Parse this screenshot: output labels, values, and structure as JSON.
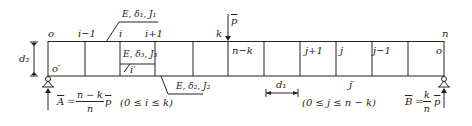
{
  "diagram": {
    "type": "truss-beam-loading",
    "top_left_label": "o",
    "labels_top": {
      "i_minus_1": "i−1",
      "i": "i",
      "i_plus_1": "i+1",
      "k": "k",
      "n": "n"
    },
    "load": {
      "label": "p"
    },
    "panel_labels": {
      "n_minus_k": "n−k",
      "j_plus_1": "j+1",
      "j": "j",
      "j_minus_1": "j−1",
      "o_right": "o"
    },
    "bottom_labels": {
      "o_prime": "o′",
      "i_prime": "i′",
      "j_prime": "j′"
    },
    "top_chord_props": "E, δ₁, J₁",
    "vertical_props": "E, δ₃, J₃",
    "bottom_chord_props": "E, δ₂, J₂",
    "height_dim": "d₂",
    "panel_dim": "d₁",
    "left_reaction": {
      "lhs": "A",
      "num": "n − k",
      "den": "n",
      "tail": "p"
    },
    "right_reaction": {
      "lhs": "B",
      "num": "k",
      "den": "n",
      "tail": "p"
    },
    "range_left": "(0 ≤ i ≤ k)",
    "range_right": "(0 ≤ j ≤ n − k)"
  }
}
